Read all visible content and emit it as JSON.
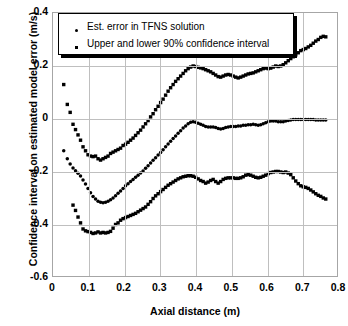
{
  "chart_data": {
    "type": "scatter",
    "title": "",
    "xlabel": "Axial distance (m)",
    "ylabel": "Confidence interval on estimated model error (m/s)",
    "xlim": [
      0,
      0.8
    ],
    "ylim": [
      -0.6,
      0.4
    ],
    "xticks": [
      "0",
      "0.1",
      "0.2",
      "0.3",
      "0.4",
      "0.5",
      "0.6",
      "0.7",
      "0.8"
    ],
    "xtick_values": [
      0,
      0.1,
      0.2,
      0.3,
      0.4,
      0.5,
      0.6,
      0.7,
      0.8
    ],
    "yticks": [
      "0.4",
      "0.2",
      "0",
      "-0.2",
      "-0.4",
      "-0.6"
    ],
    "ytick_values": [
      0.4,
      0.2,
      0,
      -0.2,
      -0.4,
      -0.6
    ],
    "grid": true,
    "legend_position": "top-left",
    "marker_color": "#000000",
    "grid_color": "#bfbfbf",
    "series": [
      {
        "name": "Upper 90% confidence interval",
        "legend_ref": "Upper and lower 90% confidence interval",
        "marker": "square",
        "x": [
          0.03,
          0.04,
          0.048,
          0.056,
          0.063,
          0.07,
          0.077,
          0.084,
          0.091,
          0.098,
          0.105,
          0.112,
          0.119,
          0.126,
          0.133,
          0.14,
          0.147,
          0.154,
          0.161,
          0.168,
          0.175,
          0.182,
          0.189,
          0.196,
          0.203,
          0.21,
          0.217,
          0.224,
          0.231,
          0.238,
          0.245,
          0.252,
          0.259,
          0.266,
          0.273,
          0.28,
          0.287,
          0.294,
          0.301,
          0.308,
          0.315,
          0.322,
          0.329,
          0.336,
          0.343,
          0.35,
          0.357,
          0.364,
          0.371,
          0.378,
          0.385,
          0.392,
          0.399,
          0.406,
          0.413,
          0.42,
          0.427,
          0.434,
          0.441,
          0.448,
          0.455,
          0.462,
          0.469,
          0.476,
          0.483,
          0.49,
          0.497,
          0.504,
          0.511,
          0.518,
          0.525,
          0.532,
          0.539,
          0.546,
          0.553,
          0.56,
          0.567,
          0.574,
          0.581,
          0.588,
          0.595,
          0.602,
          0.609,
          0.616,
          0.623,
          0.63,
          0.637,
          0.644,
          0.651,
          0.658,
          0.665,
          0.672,
          0.679,
          0.686,
          0.693,
          0.7,
          0.707,
          0.714,
          0.721,
          0.728,
          0.735,
          0.742,
          0.749,
          0.756,
          0.763
        ],
        "y": [
          0.13,
          0.055,
          0.025,
          -0.02,
          -0.04,
          -0.06,
          -0.08,
          -0.105,
          -0.12,
          -0.135,
          -0.14,
          -0.142,
          -0.14,
          -0.15,
          -0.155,
          -0.15,
          -0.145,
          -0.14,
          -0.13,
          -0.125,
          -0.12,
          -0.115,
          -0.11,
          -0.1,
          -0.095,
          -0.088,
          -0.08,
          -0.072,
          -0.062,
          -0.052,
          -0.042,
          -0.03,
          -0.018,
          -0.006,
          0.008,
          0.02,
          0.035,
          0.048,
          0.062,
          0.075,
          0.09,
          0.105,
          0.118,
          0.13,
          0.142,
          0.152,
          0.162,
          0.172,
          0.182,
          0.19,
          0.196,
          0.2,
          0.198,
          0.195,
          0.193,
          0.19,
          0.186,
          0.182,
          0.178,
          0.172,
          0.166,
          0.16,
          0.158,
          0.162,
          0.166,
          0.168,
          0.166,
          0.162,
          0.158,
          0.155,
          0.158,
          0.162,
          0.166,
          0.17,
          0.172,
          0.174,
          0.178,
          0.182,
          0.186,
          0.19,
          0.192,
          0.19,
          0.192,
          0.196,
          0.2,
          0.198,
          0.2,
          0.205,
          0.212,
          0.22,
          0.228,
          0.235,
          0.242,
          0.25,
          0.258,
          0.262,
          0.266,
          0.272,
          0.278,
          0.286,
          0.294,
          0.3,
          0.308,
          0.312,
          0.31
        ]
      },
      {
        "name": "Est. error in TFNS solution",
        "legend_ref": "Est. error in TFNS solution",
        "marker": "dot",
        "x": [
          0.03,
          0.04,
          0.048,
          0.056,
          0.063,
          0.07,
          0.077,
          0.084,
          0.091,
          0.098,
          0.105,
          0.112,
          0.119,
          0.126,
          0.133,
          0.14,
          0.147,
          0.154,
          0.161,
          0.168,
          0.175,
          0.182,
          0.189,
          0.196,
          0.203,
          0.21,
          0.217,
          0.224,
          0.231,
          0.238,
          0.245,
          0.252,
          0.259,
          0.266,
          0.273,
          0.28,
          0.287,
          0.294,
          0.301,
          0.308,
          0.315,
          0.322,
          0.329,
          0.336,
          0.343,
          0.35,
          0.357,
          0.364,
          0.371,
          0.378,
          0.385,
          0.392,
          0.399,
          0.406,
          0.413,
          0.42,
          0.427,
          0.434,
          0.441,
          0.448,
          0.455,
          0.462,
          0.469,
          0.476,
          0.483,
          0.49,
          0.497,
          0.504,
          0.511,
          0.518,
          0.525,
          0.532,
          0.539,
          0.546,
          0.553,
          0.56,
          0.567,
          0.574,
          0.581,
          0.588,
          0.595,
          0.602,
          0.609,
          0.616,
          0.623,
          0.63,
          0.637,
          0.644,
          0.651,
          0.658,
          0.665,
          0.672,
          0.679,
          0.686,
          0.693,
          0.7,
          0.707,
          0.714,
          0.721,
          0.728,
          0.735,
          0.742,
          0.749,
          0.756,
          0.763
        ],
        "y": [
          -0.12,
          -0.15,
          -0.17,
          -0.185,
          -0.195,
          -0.205,
          -0.215,
          -0.23,
          -0.245,
          -0.262,
          -0.278,
          -0.292,
          -0.302,
          -0.31,
          -0.314,
          -0.316,
          -0.314,
          -0.31,
          -0.305,
          -0.298,
          -0.29,
          -0.28,
          -0.272,
          -0.262,
          -0.252,
          -0.244,
          -0.236,
          -0.228,
          -0.22,
          -0.212,
          -0.204,
          -0.196,
          -0.186,
          -0.176,
          -0.166,
          -0.156,
          -0.146,
          -0.136,
          -0.126,
          -0.116,
          -0.105,
          -0.094,
          -0.084,
          -0.074,
          -0.064,
          -0.054,
          -0.044,
          -0.034,
          -0.026,
          -0.018,
          -0.012,
          -0.01,
          -0.012,
          -0.016,
          -0.02,
          -0.024,
          -0.028,
          -0.03,
          -0.03,
          -0.03,
          -0.032,
          -0.036,
          -0.038,
          -0.036,
          -0.032,
          -0.03,
          -0.028,
          -0.028,
          -0.028,
          -0.026,
          -0.026,
          -0.024,
          -0.024,
          -0.022,
          -0.022,
          -0.02,
          -0.022,
          -0.024,
          -0.022,
          -0.018,
          -0.014,
          -0.01,
          -0.008,
          -0.008,
          -0.008,
          -0.01,
          -0.01,
          -0.01,
          -0.008,
          -0.006,
          -0.004,
          -0.002,
          -0.002,
          -0.002,
          -0.002,
          -0.002,
          -0.002,
          -0.002,
          -0.002,
          -0.002,
          -0.004,
          -0.004,
          -0.004,
          -0.004,
          -0.004
        ]
      },
      {
        "name": "Lower 90% confidence interval",
        "legend_ref": "Upper and lower 90% confidence interval",
        "marker": "square",
        "x": [
          0.056,
          0.063,
          0.07,
          0.077,
          0.084,
          0.091,
          0.098,
          0.105,
          0.112,
          0.119,
          0.126,
          0.133,
          0.14,
          0.147,
          0.154,
          0.161,
          0.168,
          0.175,
          0.182,
          0.189,
          0.196,
          0.203,
          0.21,
          0.217,
          0.224,
          0.231,
          0.238,
          0.245,
          0.252,
          0.259,
          0.266,
          0.273,
          0.28,
          0.287,
          0.294,
          0.301,
          0.308,
          0.315,
          0.322,
          0.329,
          0.336,
          0.343,
          0.35,
          0.357,
          0.364,
          0.371,
          0.378,
          0.385,
          0.392,
          0.399,
          0.406,
          0.413,
          0.42,
          0.427,
          0.434,
          0.441,
          0.448,
          0.455,
          0.462,
          0.469,
          0.476,
          0.483,
          0.49,
          0.497,
          0.504,
          0.511,
          0.518,
          0.525,
          0.532,
          0.539,
          0.546,
          0.553,
          0.56,
          0.567,
          0.574,
          0.581,
          0.588,
          0.595,
          0.602,
          0.609,
          0.616,
          0.623,
          0.63,
          0.637,
          0.644,
          0.651,
          0.658,
          0.665,
          0.672,
          0.679,
          0.686,
          0.693,
          0.7,
          0.707,
          0.714,
          0.721,
          0.728,
          0.735,
          0.742,
          0.749,
          0.756,
          0.763
        ],
        "y": [
          -0.325,
          -0.345,
          -0.37,
          -0.392,
          -0.415,
          -0.422,
          -0.425,
          -0.428,
          -0.432,
          -0.43,
          -0.426,
          -0.43,
          -0.428,
          -0.43,
          -0.428,
          -0.424,
          -0.412,
          -0.398,
          -0.392,
          -0.382,
          -0.376,
          -0.372,
          -0.368,
          -0.364,
          -0.36,
          -0.356,
          -0.35,
          -0.344,
          -0.338,
          -0.332,
          -0.322,
          -0.312,
          -0.3,
          -0.29,
          -0.282,
          -0.274,
          -0.266,
          -0.258,
          -0.25,
          -0.244,
          -0.238,
          -0.232,
          -0.226,
          -0.222,
          -0.218,
          -0.216,
          -0.214,
          -0.214,
          -0.216,
          -0.22,
          -0.226,
          -0.232,
          -0.236,
          -0.242,
          -0.238,
          -0.232,
          -0.228,
          -0.236,
          -0.242,
          -0.236,
          -0.228,
          -0.224,
          -0.222,
          -0.222,
          -0.222,
          -0.224,
          -0.224,
          -0.222,
          -0.218,
          -0.212,
          -0.21,
          -0.212,
          -0.216,
          -0.22,
          -0.222,
          -0.22,
          -0.216,
          -0.212,
          -0.206,
          -0.202,
          -0.2,
          -0.198,
          -0.198,
          -0.2,
          -0.202,
          -0.2,
          -0.204,
          -0.21,
          -0.222,
          -0.234,
          -0.244,
          -0.252,
          -0.256,
          -0.258,
          -0.262,
          -0.268,
          -0.275,
          -0.282,
          -0.288,
          -0.292,
          -0.298,
          -0.302
        ]
      }
    ]
  },
  "legend": {
    "entries": [
      {
        "label": "Est.  error in TFNS solution",
        "marker": "dot"
      },
      {
        "label": "Upper and lower 90% confidence interval",
        "marker": "square"
      }
    ]
  }
}
